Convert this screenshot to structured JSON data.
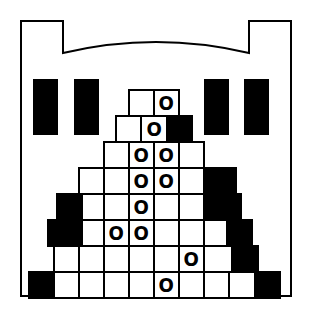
{
  "board": {
    "width": 310,
    "height": 316,
    "background": "#ffffff",
    "ink": "#000000"
  },
  "castle": {
    "stroke_width": 2,
    "windows": [
      {
        "x": 33,
        "y": 79,
        "w": 25,
        "h": 56
      },
      {
        "x": 74,
        "y": 79,
        "w": 25,
        "h": 56
      },
      {
        "x": 204,
        "y": 79,
        "w": 25,
        "h": 56
      },
      {
        "x": 244,
        "y": 79,
        "w": 25,
        "h": 56
      }
    ]
  },
  "pyramid": {
    "brick_height": 26,
    "marble_glyph": "O",
    "rows": [
      {
        "y": 89,
        "bricks": [
          {
            "x": 128,
            "w": 25,
            "t": "plain"
          },
          {
            "x": 153,
            "w": 25,
            "t": "marble"
          }
        ]
      },
      {
        "y": 115,
        "bricks": [
          {
            "x": 115,
            "w": 25,
            "t": "plain"
          },
          {
            "x": 140,
            "w": 26,
            "t": "marble"
          },
          {
            "x": 166,
            "w": 25,
            "t": "solid"
          }
        ]
      },
      {
        "y": 141,
        "bricks": [
          {
            "x": 103,
            "w": 25,
            "t": "plain"
          },
          {
            "x": 128,
            "w": 25,
            "t": "marble"
          },
          {
            "x": 153,
            "w": 25,
            "t": "marble"
          },
          {
            "x": 178,
            "w": 25,
            "t": "plain"
          }
        ]
      },
      {
        "y": 167,
        "bricks": [
          {
            "x": 78,
            "w": 25,
            "t": "plain"
          },
          {
            "x": 103,
            "w": 25,
            "t": "plain"
          },
          {
            "x": 128,
            "w": 25,
            "t": "marble"
          },
          {
            "x": 153,
            "w": 25,
            "t": "marble"
          },
          {
            "x": 178,
            "w": 25,
            "t": "plain"
          },
          {
            "x": 203,
            "w": 32,
            "t": "solid"
          }
        ]
      },
      {
        "y": 193,
        "bricks": [
          {
            "x": 56,
            "w": 25,
            "t": "solid"
          },
          {
            "x": 81,
            "w": 22,
            "t": "plain"
          },
          {
            "x": 103,
            "w": 25,
            "t": "plain"
          },
          {
            "x": 128,
            "w": 25,
            "t": "marble"
          },
          {
            "x": 153,
            "w": 25,
            "t": "plain"
          },
          {
            "x": 178,
            "w": 25,
            "t": "plain"
          },
          {
            "x": 203,
            "w": 37,
            "t": "solid"
          }
        ]
      },
      {
        "y": 219,
        "bricks": [
          {
            "x": 47,
            "w": 34,
            "t": "solid"
          },
          {
            "x": 81,
            "w": 22,
            "t": "plain"
          },
          {
            "x": 103,
            "w": 25,
            "t": "marble"
          },
          {
            "x": 128,
            "w": 25,
            "t": "marble"
          },
          {
            "x": 153,
            "w": 25,
            "t": "plain"
          },
          {
            "x": 178,
            "w": 25,
            "t": "plain"
          },
          {
            "x": 203,
            "w": 23,
            "t": "plain"
          },
          {
            "x": 226,
            "w": 25,
            "t": "solid"
          }
        ]
      },
      {
        "y": 245,
        "bricks": [
          {
            "x": 53,
            "w": 25,
            "t": "plain"
          },
          {
            "x": 78,
            "w": 25,
            "t": "plain"
          },
          {
            "x": 103,
            "w": 25,
            "t": "plain"
          },
          {
            "x": 128,
            "w": 25,
            "t": "plain"
          },
          {
            "x": 153,
            "w": 25,
            "t": "plain"
          },
          {
            "x": 178,
            "w": 25,
            "t": "marble"
          },
          {
            "x": 203,
            "w": 28,
            "t": "plain"
          },
          {
            "x": 231,
            "w": 26,
            "t": "solid"
          }
        ]
      },
      {
        "y": 271,
        "bricks": [
          {
            "x": 28,
            "w": 25,
            "t": "solid"
          },
          {
            "x": 53,
            "w": 25,
            "t": "plain"
          },
          {
            "x": 78,
            "w": 25,
            "t": "plain"
          },
          {
            "x": 103,
            "w": 25,
            "t": "plain"
          },
          {
            "x": 128,
            "w": 25,
            "t": "plain"
          },
          {
            "x": 153,
            "w": 25,
            "t": "marble"
          },
          {
            "x": 178,
            "w": 25,
            "t": "plain"
          },
          {
            "x": 203,
            "w": 25,
            "t": "plain"
          },
          {
            "x": 228,
            "w": 26,
            "t": "plain"
          },
          {
            "x": 254,
            "w": 25,
            "t": "solid"
          }
        ]
      }
    ]
  }
}
